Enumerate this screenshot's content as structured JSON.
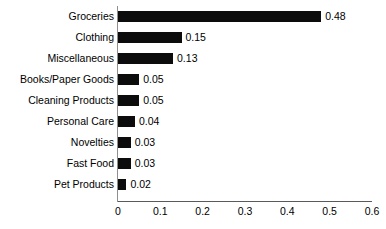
{
  "chart_data": {
    "type": "bar",
    "orientation": "horizontal",
    "title": "",
    "xlabel": "",
    "ylabel": "",
    "xlim": [
      0,
      0.6
    ],
    "grid": false,
    "legend": false,
    "bar_color": "#0c0c0c",
    "background_color": "#ffffff",
    "axis_color": "#5a5a5a",
    "xticks": [
      "0",
      "0.1",
      "0.2",
      "0.3",
      "0.4",
      "0.5",
      "0.6"
    ],
    "xtick_values": [
      0,
      0.1,
      0.2,
      0.3,
      0.4,
      0.5,
      0.6
    ],
    "categories": [
      "Groceries",
      "Clothing",
      "Miscellaneous",
      "Books/Paper Goods",
      "Cleaning Products",
      "Personal Care",
      "Novelties",
      "Fast Food",
      "Pet Products"
    ],
    "values": [
      0.48,
      0.15,
      0.13,
      0.05,
      0.05,
      0.04,
      0.03,
      0.03,
      0.02
    ],
    "value_labels": [
      "0.48",
      "0.15",
      "0.13",
      "0.05",
      "0.05",
      "0.04",
      "0.03",
      "0.03",
      "0.02"
    ]
  }
}
